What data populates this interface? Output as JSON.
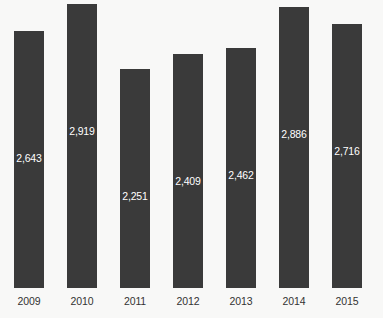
{
  "chart_data": {
    "type": "bar",
    "title": "",
    "subtitle": "",
    "xlabel": "",
    "ylabel": "",
    "categories": [
      "2009",
      "2010",
      "2011",
      "2012",
      "2013",
      "2014",
      "2015"
    ],
    "values": [
      2643,
      2919,
      2251,
      2409,
      2462,
      2886,
      2716
    ],
    "value_labels": [
      "2,643",
      "2,919",
      "2,251",
      "2,409",
      "2,462",
      "2,886",
      "2,716"
    ],
    "ylim": [
      0,
      2919
    ],
    "grid": false,
    "legend": false,
    "legend_position": "none",
    "annotations": [],
    "bar_color": "#3a3a3a",
    "value_label_color": "#ffffff",
    "axis_label_color": "#333333",
    "background_color": "#f8f8f7"
  }
}
